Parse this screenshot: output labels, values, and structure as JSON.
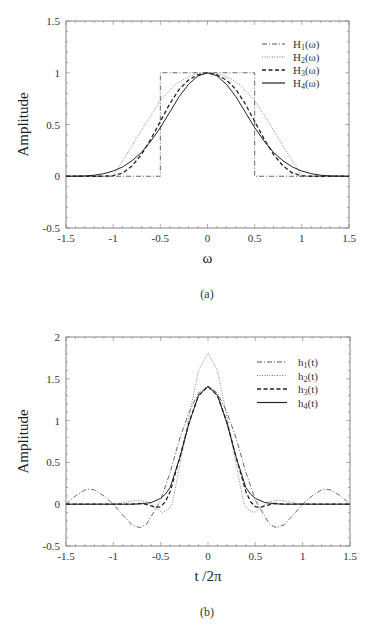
{
  "chart_data": [
    {
      "id": "a",
      "type": "line",
      "caption": "(a)",
      "xlabel": "ω",
      "ylabel": "Amplitude",
      "xlim": [
        -1.5,
        1.5
      ],
      "ylim": [
        -0.5,
        1.5
      ],
      "xticks": [
        -1.5,
        -1,
        -0.5,
        0,
        0.5,
        1,
        1.5
      ],
      "xtick_labels": [
        "-1.5",
        "-1",
        "-0.5",
        "0",
        "0.5",
        "1",
        "1.5"
      ],
      "yticks": [
        -0.5,
        0,
        0.5,
        1,
        1.5
      ],
      "ytick_labels": [
        "-0.5",
        "0",
        "0.5",
        "1",
        "1.5"
      ],
      "grid": false,
      "legend_position": "upper right",
      "frame": {
        "left": 66,
        "top": 21,
        "right": 349,
        "bottom": 228
      },
      "series": [
        {
          "name": "H1(ω)",
          "label_main": "H",
          "label_sub": "1",
          "label_arg": "(ω)",
          "style": "dashdot",
          "color": "#555555",
          "width": 0.9,
          "x": [
            -1.5,
            -0.5,
            -0.5,
            0.5,
            0.5,
            1.5
          ],
          "y": [
            0,
            0,
            1,
            1,
            0,
            0
          ]
        },
        {
          "name": "H2(ω)",
          "label_main": "H",
          "label_sub": "2",
          "label_arg": "(ω)",
          "style": "dotted",
          "color": "#777777",
          "width": 0.9,
          "x": [
            -1.5,
            -1.0,
            -0.95,
            -0.85,
            -0.75,
            -0.65,
            -0.5,
            -0.35,
            -0.25,
            -0.12,
            0,
            0.12,
            0.25,
            0.35,
            0.5,
            0.65,
            0.75,
            0.85,
            0.95,
            1.0,
            1.5
          ],
          "y": [
            0,
            0,
            0.08,
            0.22,
            0.37,
            0.52,
            0.73,
            0.88,
            0.94,
            0.99,
            1.0,
            0.99,
            0.94,
            0.88,
            0.73,
            0.52,
            0.37,
            0.22,
            0.08,
            0,
            0
          ]
        },
        {
          "name": "H3(ω)",
          "label_main": "H",
          "label_sub": "3",
          "label_arg": "(ω)",
          "style": "dashed",
          "color": "#222222",
          "width": 1.3,
          "x": [
            -1.5,
            -1.1,
            -1.0,
            -0.9,
            -0.8,
            -0.7,
            -0.6,
            -0.5,
            -0.4,
            -0.3,
            -0.2,
            -0.1,
            0,
            0.1,
            0.2,
            0.3,
            0.4,
            0.5,
            0.6,
            0.7,
            0.8,
            0.9,
            1.0,
            1.1,
            1.5
          ],
          "y": [
            0,
            0,
            0.005,
            0.03,
            0.1,
            0.21,
            0.36,
            0.53,
            0.7,
            0.84,
            0.93,
            0.98,
            1.0,
            0.98,
            0.93,
            0.84,
            0.7,
            0.53,
            0.36,
            0.21,
            0.1,
            0.03,
            0.005,
            0,
            0
          ]
        },
        {
          "name": "H4(ω)",
          "label_main": "H",
          "label_sub": "4",
          "label_arg": "(ω)",
          "style": "solid",
          "color": "#222222",
          "width": 1.0,
          "x": [
            -1.5,
            -1.3,
            -1.2,
            -1.1,
            -1.0,
            -0.9,
            -0.8,
            -0.7,
            -0.6,
            -0.5,
            -0.4,
            -0.3,
            -0.2,
            -0.1,
            0,
            0.1,
            0.2,
            0.3,
            0.4,
            0.5,
            0.6,
            0.7,
            0.8,
            0.9,
            1.0,
            1.1,
            1.2,
            1.3,
            1.5
          ],
          "y": [
            0,
            0.003,
            0.01,
            0.025,
            0.05,
            0.09,
            0.15,
            0.23,
            0.34,
            0.47,
            0.62,
            0.77,
            0.89,
            0.97,
            1.0,
            0.97,
            0.89,
            0.77,
            0.62,
            0.47,
            0.34,
            0.23,
            0.15,
            0.09,
            0.05,
            0.025,
            0.01,
            0.003,
            0
          ]
        }
      ]
    },
    {
      "id": "b",
      "type": "line",
      "caption": "(b)",
      "xlabel": "t /2π",
      "ylabel": "Amplitude",
      "xlim": [
        -1.5,
        1.5
      ],
      "ylim": [
        -0.5,
        2
      ],
      "xticks": [
        -1.5,
        -1,
        -0.5,
        0,
        0.5,
        1,
        1.5
      ],
      "xtick_labels": [
        "-1.5",
        "-1",
        "-0.5",
        "0",
        "0.5",
        "1",
        "1.5"
      ],
      "yticks": [
        -0.5,
        0,
        0.5,
        1,
        1.5,
        2
      ],
      "ytick_labels": [
        "-0.5",
        "0",
        "0.5",
        "1",
        "1.5",
        "2"
      ],
      "grid": false,
      "legend_position": "upper right",
      "frame": {
        "left": 66,
        "top": 337,
        "right": 350,
        "bottom": 546
      },
      "series": [
        {
          "name": "h1(t)",
          "label_main": "h",
          "label_sub": "1",
          "label_arg": "(t)",
          "style": "dashdot",
          "color": "#555555",
          "width": 0.9,
          "x": [
            -1.5,
            -1.4,
            -1.3,
            -1.25,
            -1.2,
            -1.1,
            -1.0,
            -0.9,
            -0.8,
            -0.72,
            -0.65,
            -0.55,
            -0.5,
            -0.4,
            -0.3,
            -0.2,
            -0.1,
            0,
            0.1,
            0.2,
            0.3,
            0.4,
            0.5,
            0.55,
            0.65,
            0.72,
            0.8,
            0.9,
            1.0,
            1.1,
            1.2,
            1.25,
            1.3,
            1.4,
            1.5
          ],
          "y": [
            0,
            0.1,
            0.17,
            0.18,
            0.17,
            0.1,
            0,
            -0.13,
            -0.25,
            -0.28,
            -0.24,
            -0.05,
            0.05,
            0.38,
            0.78,
            1.1,
            1.33,
            1.41,
            1.33,
            1.1,
            0.78,
            0.38,
            0.05,
            -0.05,
            -0.24,
            -0.28,
            -0.25,
            -0.13,
            0,
            0.1,
            0.17,
            0.18,
            0.17,
            0.1,
            0
          ]
        },
        {
          "name": "h2(t)",
          "label_main": "h",
          "label_sub": "2",
          "label_arg": "(t)",
          "style": "dotted",
          "color": "#777777",
          "width": 0.9,
          "x": [
            -1.5,
            -1.0,
            -0.85,
            -0.75,
            -0.62,
            -0.55,
            -0.48,
            -0.42,
            -0.38,
            -0.3,
            -0.2,
            -0.1,
            0,
            0.1,
            0.2,
            0.3,
            0.38,
            0.42,
            0.48,
            0.55,
            0.62,
            0.75,
            0.85,
            1.0,
            1.5
          ],
          "y": [
            0,
            0,
            0.03,
            0.05,
            0.02,
            -0.05,
            -0.1,
            -0.06,
            0.0,
            0.45,
            1.05,
            1.6,
            1.81,
            1.6,
            1.05,
            0.45,
            0.0,
            -0.06,
            -0.1,
            -0.05,
            0.02,
            0.05,
            0.03,
            0,
            0
          ]
        },
        {
          "name": "h3(t)",
          "label_main": "h",
          "label_sub": "3",
          "label_arg": "(t)",
          "style": "dashed",
          "color": "#222222",
          "width": 1.3,
          "x": [
            -1.5,
            -0.8,
            -0.7,
            -0.6,
            -0.55,
            -0.5,
            -0.45,
            -0.4,
            -0.3,
            -0.2,
            -0.1,
            0,
            0.1,
            0.2,
            0.3,
            0.4,
            0.45,
            0.5,
            0.55,
            0.6,
            0.7,
            0.8,
            1.5
          ],
          "y": [
            0,
            0,
            0.01,
            -0.02,
            -0.04,
            -0.03,
            0.03,
            0.15,
            0.55,
            0.98,
            1.3,
            1.41,
            1.3,
            0.98,
            0.55,
            0.15,
            0.03,
            -0.03,
            -0.04,
            -0.02,
            0.01,
            0,
            0
          ]
        },
        {
          "name": "h4(t)",
          "label_main": "h",
          "label_sub": "4",
          "label_arg": "(t)",
          "style": "solid",
          "color": "#222222",
          "width": 1.0,
          "x": [
            -1.5,
            -0.8,
            -0.7,
            -0.6,
            -0.5,
            -0.45,
            -0.4,
            -0.3,
            -0.2,
            -0.1,
            0,
            0.1,
            0.2,
            0.3,
            0.4,
            0.45,
            0.5,
            0.6,
            0.7,
            0.8,
            1.5
          ],
          "y": [
            0,
            0,
            0.005,
            0.02,
            0.07,
            0.12,
            0.2,
            0.55,
            0.97,
            1.3,
            1.41,
            1.3,
            0.97,
            0.55,
            0.2,
            0.12,
            0.07,
            0.02,
            0.005,
            0,
            0
          ]
        }
      ]
    }
  ]
}
